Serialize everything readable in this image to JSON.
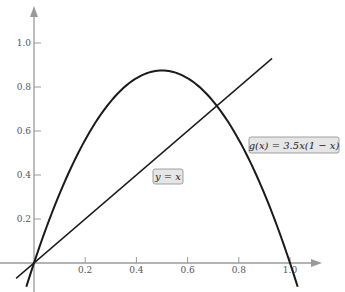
{
  "chart_data": {
    "type": "line",
    "title": "",
    "xlabel": "",
    "ylabel": "",
    "xlim": [
      -0.07,
      1.15
    ],
    "ylim": [
      -0.13,
      1.19
    ],
    "x_ticks": [
      {
        "value": 0.2,
        "label": "0.2"
      },
      {
        "value": 0.4,
        "label": "0.4"
      },
      {
        "value": 0.6,
        "label": "0.6"
      },
      {
        "value": 0.8,
        "label": "0.8"
      },
      {
        "value": 1.0,
        "label": "1.0"
      }
    ],
    "y_ticks": [
      {
        "value": 0.2,
        "label": "0.2"
      },
      {
        "value": 0.4,
        "label": "0.4"
      },
      {
        "value": 0.6,
        "label": "0.6"
      },
      {
        "value": 0.8,
        "label": "0.8"
      },
      {
        "value": 1.0,
        "label": "1.0"
      }
    ],
    "grid": false,
    "series": [
      {
        "name": "g(x) = 3.5x(1 − x)",
        "label": "g(x) = 3.5x(1 − x)",
        "function": "3.5*x*(1-x)",
        "x_range": [
          -0.03,
          1.03
        ],
        "x": [
          0,
          0.1,
          0.2,
          0.3,
          0.4,
          0.5,
          0.6,
          0.7,
          0.8,
          0.9,
          1.0
        ],
        "values": [
          0,
          0.315,
          0.56,
          0.735,
          0.84,
          0.875,
          0.84,
          0.735,
          0.56,
          0.315,
          0
        ]
      },
      {
        "name": "y = x",
        "label": "y = x",
        "function": "x",
        "x_range": [
          -0.07,
          0.93
        ],
        "x": [
          0,
          0.2,
          0.4,
          0.6,
          0.8,
          0.9
        ],
        "values": [
          0,
          0.2,
          0.4,
          0.6,
          0.8,
          0.9
        ]
      }
    ],
    "annotations": [
      {
        "text": "g(x) = 3.5x(1 − x)",
        "near": [
          0.87,
          0.57
        ]
      },
      {
        "text": "y = x",
        "near": [
          0.52,
          0.36
        ]
      }
    ],
    "intersection": {
      "x": 0.714,
      "y": 0.714
    }
  },
  "labels": {
    "g": "g(x) = 3.5x(1 − x)",
    "id": "y = x"
  },
  "colors": {
    "axis": "#9a9a9a",
    "curve": "#1a1a1a",
    "label_bg": "#e6e6e6",
    "label_border": "#8a8a8a"
  }
}
